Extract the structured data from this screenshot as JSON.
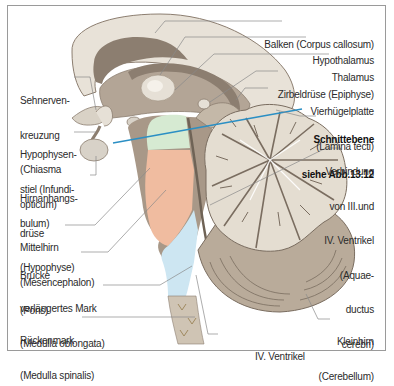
{
  "figure": {
    "colors": {
      "frame": "#9a9a9a",
      "outer_tissue": "#e6e0d6",
      "dark_tissue": "#8c7e70",
      "mid_tissue": "#b3a596",
      "midbrain_green": "#d6ead2",
      "pons_salmon": "#f0bca0",
      "medulla_blue": "#cde6f2",
      "cut_line": "#2b8fc4",
      "leader": "#8a8a8a"
    },
    "cut_plane_label": {
      "line1": "Schnittebene",
      "line2": "siehe Abb.13.12"
    }
  },
  "labels_left": [
    {
      "id": "chiasma",
      "lines": [
        "Sehnerven-",
        "kreuzung",
        "(Chiasma",
        "opticum)"
      ]
    },
    {
      "id": "infundibulum",
      "lines": [
        "Hypophysen-",
        "stiel (Infundi-",
        "bulum)"
      ]
    },
    {
      "id": "hypophyse",
      "lines": [
        "Hirnanhangs-",
        "drüse",
        "(Hypophyse)"
      ]
    },
    {
      "id": "mesencephalon",
      "lines": [
        "Mittelhirn",
        "(Mesencephalon)"
      ]
    },
    {
      "id": "pons",
      "lines": [
        "Brücke",
        "(Pons)"
      ]
    },
    {
      "id": "medulla-oblongata",
      "lines": [
        "verlängertes Mark",
        "(Medulla oblongata)"
      ]
    },
    {
      "id": "medulla-spinalis",
      "lines": [
        "Rückenmark",
        "(Medulla spinalis)"
      ]
    }
  ],
  "labels_right": [
    {
      "id": "corpus-callosum",
      "lines": [
        "Balken (Corpus callosum)"
      ]
    },
    {
      "id": "hypothalamus",
      "lines": [
        "Hypothalamus"
      ]
    },
    {
      "id": "thalamus",
      "lines": [
        "Thalamus"
      ]
    },
    {
      "id": "epiphyse",
      "lines": [
        "Zirbeldrüse (Epiphyse)"
      ]
    },
    {
      "id": "lamina-tecti",
      "lines": [
        "Vierhügelplatte",
        "(Lamina tecti)"
      ]
    },
    {
      "id": "aquaeductus",
      "lines": [
        "Verbindung",
        "von III.und",
        "IV. Ventrikel",
        "(Aquae-",
        "ductus",
        "cerebri)"
      ]
    }
  ],
  "labels_bottom": [
    {
      "id": "ventrikel-iv",
      "lines": [
        "IV. Ventrikel"
      ]
    },
    {
      "id": "cerebellum",
      "lines": [
        "Kleinhirn",
        "(Cerebellum)"
      ]
    }
  ]
}
